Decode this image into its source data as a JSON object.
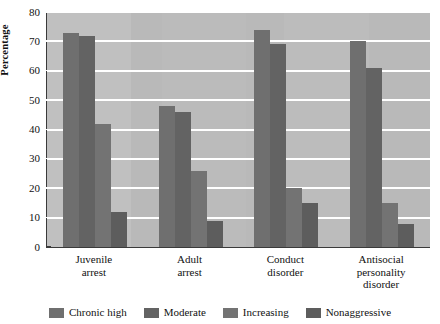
{
  "chart_data": {
    "type": "bar",
    "title": "",
    "xlabel": "",
    "ylabel": "Percentage",
    "ylim": [
      0,
      80
    ],
    "yticks": [
      0,
      10,
      20,
      30,
      40,
      50,
      60,
      70,
      80
    ],
    "grid": true,
    "legend_position": "bottom",
    "categories": [
      "Juvenile\narrest",
      "Adult\narrest",
      "Conduct\ndisorder",
      "Antisocial\npersonality\ndisorder"
    ],
    "series": [
      {
        "name": "Chronic high",
        "values": [
          73,
          48,
          74,
          70
        ]
      },
      {
        "name": "Moderate",
        "values": [
          72,
          46,
          69,
          61
        ]
      },
      {
        "name": "Increasing",
        "values": [
          42,
          26,
          20,
          15
        ]
      },
      {
        "name": "Nonaggressive",
        "values": [
          12,
          9,
          15,
          8
        ]
      }
    ],
    "colors": {
      "series": [
        "#6f6f6f",
        "#636363",
        "#737373",
        "#5d5d5d"
      ],
      "plot_background": "#b9b9b9",
      "gridline": "#ffffff",
      "axis": "#3a3a3a",
      "page_background": "#ffffff",
      "text": "#111111"
    }
  }
}
